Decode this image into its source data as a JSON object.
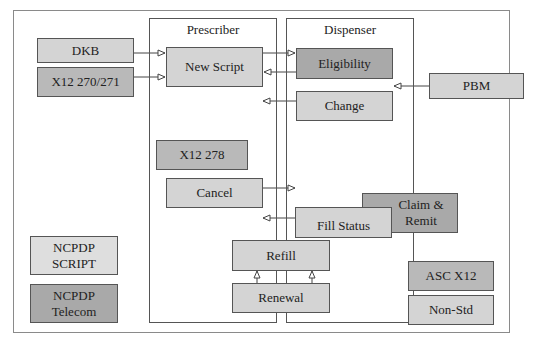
{
  "diagram": {
    "groups": {
      "prescriber": {
        "label": "Prescriber"
      },
      "dispenser": {
        "label": "Dispenser"
      }
    },
    "nodes": {
      "dkb": {
        "label": "DKB"
      },
      "x12_270_271": {
        "label": "X12 270/271"
      },
      "new_script": {
        "label": "New Script"
      },
      "eligibility": {
        "label": "Eligibility"
      },
      "change": {
        "label": "Change"
      },
      "pbm": {
        "label": "PBM"
      },
      "x12_278": {
        "label": "X12 278"
      },
      "cancel": {
        "label": "Cancel"
      },
      "fill_status": {
        "label": "Fill Status"
      },
      "claim_remit": {
        "label": "Claim & Remit"
      },
      "refill": {
        "label": "Refill"
      },
      "renewal": {
        "label": "Renewal"
      }
    },
    "legend": {
      "ncpdp_script": {
        "label": "NCPDP SCRIPT"
      },
      "ncpdp_telecom": {
        "label": "NCPDP Telecom"
      },
      "asc_x12": {
        "label": "ASC X12"
      },
      "non_std": {
        "label": "Non-Std"
      }
    },
    "colors": {
      "ncpdp_script": "#dedede",
      "ncpdp_telecom": "#a9a9a9",
      "asc_x12": "#b9b9b9",
      "non_std": "#d4d4d4",
      "border": "#555555"
    },
    "edges": [
      {
        "from": "DKB",
        "to": "New Script"
      },
      {
        "from": "X12 270/271",
        "to": "New Script"
      },
      {
        "from": "New Script",
        "to": "Eligibility"
      },
      {
        "from": "Eligibility",
        "to": "New Script"
      },
      {
        "from": "Change",
        "to": "Prescriber"
      },
      {
        "from": "PBM",
        "to": "Dispenser"
      },
      {
        "from": "Cancel",
        "to": "Dispenser"
      },
      {
        "from": "Fill Status",
        "to": "Prescriber"
      },
      {
        "from": "Renewal",
        "to": "Refill"
      }
    ]
  }
}
